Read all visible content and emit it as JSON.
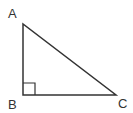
{
  "diagram": {
    "type": "right-triangle",
    "stroke_color": "#333333",
    "background_color": "#ffffff",
    "vertices": {
      "A": {
        "label": "A",
        "x": 23,
        "y": 24
      },
      "B": {
        "label": "B",
        "x": 23,
        "y": 95
      },
      "C": {
        "label": "C",
        "x": 116,
        "y": 95
      }
    },
    "right_angle_at": "B",
    "right_angle_marker_size": 12,
    "labels": {
      "A": "A",
      "B": "B",
      "C": "C"
    }
  }
}
